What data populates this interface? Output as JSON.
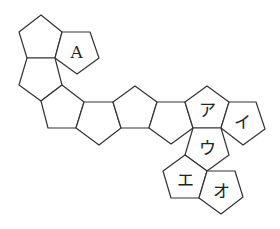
{
  "diagram": {
    "faces": [
      {
        "id": "p1",
        "label": ""
      },
      {
        "id": "pA",
        "label": "A"
      },
      {
        "id": "p2",
        "label": ""
      },
      {
        "id": "p3",
        "label": ""
      },
      {
        "id": "p4",
        "label": ""
      },
      {
        "id": "p5",
        "label": ""
      },
      {
        "id": "p6",
        "label": ""
      },
      {
        "id": "pa",
        "label": "ア"
      },
      {
        "id": "pi",
        "label": "イ"
      },
      {
        "id": "pu",
        "label": "ウ"
      },
      {
        "id": "pe",
        "label": "エ"
      },
      {
        "id": "po",
        "label": "オ"
      }
    ],
    "stroke_color": "#333333",
    "fill_color": "#ffffff"
  }
}
